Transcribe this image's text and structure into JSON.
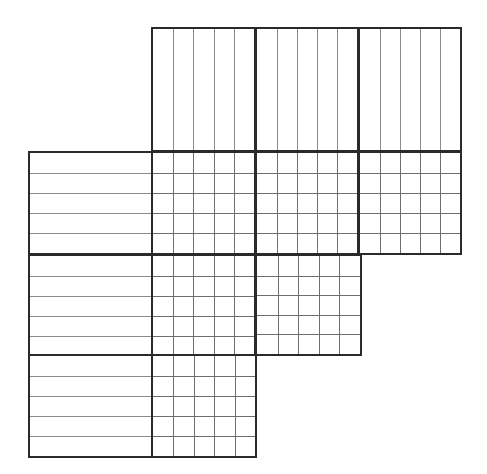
{
  "puzzle": {
    "type": "nonogram",
    "cell_size": 20.8,
    "origin": {
      "x": 28,
      "y": 27
    },
    "clue_area": {
      "col_clue_height_cells": 6,
      "row_clue_width_cells": 6
    },
    "column_clue_blocks": [
      {
        "x": 151,
        "y": 27,
        "w": 105,
        "h": 125,
        "cols": 5,
        "rows": 1,
        "clues": []
      },
      {
        "x": 255,
        "y": 27,
        "w": 104,
        "h": 125,
        "cols": 5,
        "rows": 1,
        "clues": []
      },
      {
        "x": 358,
        "y": 27,
        "w": 104,
        "h": 125,
        "cols": 5,
        "rows": 1,
        "clues": []
      }
    ],
    "row_clue_blocks": [
      {
        "x": 28,
        "y": 151,
        "w": 125,
        "h": 104,
        "cols": 1,
        "rows": 5,
        "clues": []
      },
      {
        "x": 28,
        "y": 254,
        "w": 125,
        "h": 104,
        "cols": 1,
        "rows": 5,
        "clues": []
      },
      {
        "x": 28,
        "y": 354,
        "w": 125,
        "h": 104,
        "cols": 1,
        "rows": 5,
        "clues": []
      }
    ],
    "grid_blocks": [
      {
        "x": 151,
        "y": 151,
        "w": 105,
        "h": 104,
        "cols": 5,
        "rows": 5,
        "filled": []
      },
      {
        "x": 255,
        "y": 151,
        "w": 104,
        "h": 104,
        "cols": 5,
        "rows": 5,
        "filled": []
      },
      {
        "x": 358,
        "y": 151,
        "w": 104,
        "h": 104,
        "cols": 5,
        "rows": 5,
        "filled": []
      },
      {
        "x": 151,
        "y": 254,
        "w": 105,
        "h": 104,
        "cols": 5,
        "rows": 5,
        "filled": []
      },
      {
        "x": 255,
        "y": 254,
        "w": 107,
        "h": 102,
        "cols": 5,
        "rows": 5,
        "filled": []
      },
      {
        "x": 151,
        "y": 354,
        "w": 106,
        "h": 104,
        "cols": 5,
        "rows": 5,
        "filled": []
      }
    ],
    "colors": {
      "border": "#2a2a2a",
      "thin_line": "#8a8a8a",
      "background": "#ffffff"
    }
  }
}
